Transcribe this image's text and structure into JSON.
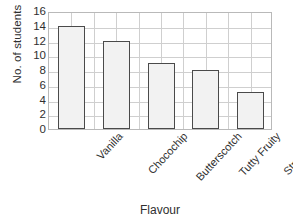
{
  "chart_data": {
    "type": "bar",
    "title": "",
    "categories": [
      "Vanilla",
      "Chocochip",
      "Butterscotch",
      "Tutty Fruity",
      "Strawberry"
    ],
    "values": [
      14,
      12,
      9,
      8,
      5
    ],
    "xlabel": "Flavour",
    "ylabel": "No. of students",
    "ylim": [
      0,
      16
    ],
    "ytick_step": 2,
    "yticks": [
      0,
      2,
      4,
      6,
      8,
      10,
      12,
      14,
      16
    ],
    "ytick_labels": [
      "0",
      "2",
      "4",
      "6",
      "8",
      "10",
      "12",
      "14",
      "16"
    ],
    "grid": true,
    "grid_vertical_divisions": 10,
    "legend": null,
    "legend_position": "none",
    "bar_fill_color": "#f2f2f2",
    "bar_border_color": "#4a4a4a",
    "grid_color": "#cfcfcf",
    "frame_color": "#b9b9b9",
    "text_color": "#2f2f2f",
    "background_color": "#ffffff",
    "xtick_label_rotation": -47
  }
}
